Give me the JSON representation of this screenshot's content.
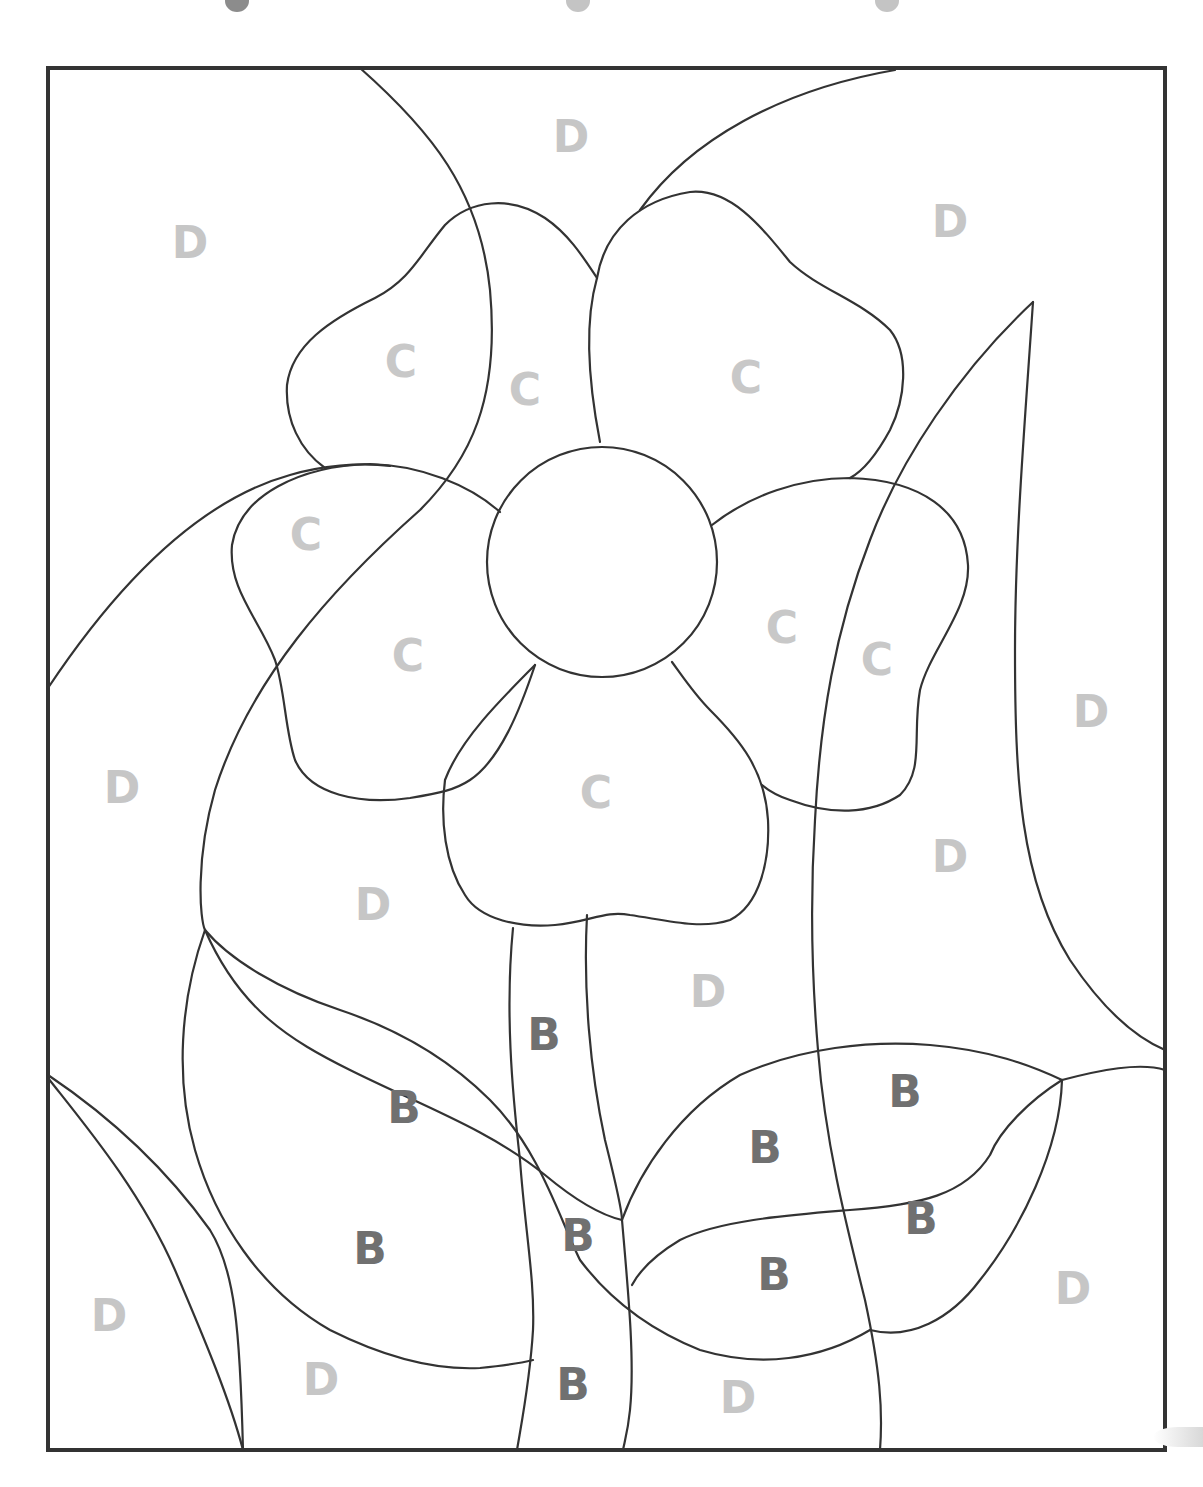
{
  "page": {
    "top_key_partial": {
      "swatches": [
        {
          "x": 225,
          "color": "#8c8c8c"
        },
        {
          "x": 566,
          "color": "#c4c4c4"
        },
        {
          "x": 875,
          "color": "#c4c4c4"
        }
      ]
    }
  },
  "legend_colors": {
    "B": "#707070",
    "C": "#c8c8c8",
    "D": "#c6c6c6"
  },
  "labels": [
    {
      "letter": "D",
      "x": 571,
      "y": 137
    },
    {
      "letter": "D",
      "x": 190,
      "y": 243
    },
    {
      "letter": "D",
      "x": 950,
      "y": 222
    },
    {
      "letter": "C",
      "x": 401,
      "y": 362
    },
    {
      "letter": "C",
      "x": 525,
      "y": 390
    },
    {
      "letter": "C",
      "x": 746,
      "y": 378
    },
    {
      "letter": "C",
      "x": 306,
      "y": 535
    },
    {
      "letter": "C",
      "x": 408,
      "y": 656
    },
    {
      "letter": "C",
      "x": 782,
      "y": 628
    },
    {
      "letter": "C",
      "x": 877,
      "y": 660
    },
    {
      "letter": "C",
      "x": 596,
      "y": 793
    },
    {
      "letter": "D",
      "x": 1091,
      "y": 712
    },
    {
      "letter": "D",
      "x": 122,
      "y": 788
    },
    {
      "letter": "D",
      "x": 950,
      "y": 857
    },
    {
      "letter": "D",
      "x": 373,
      "y": 905
    },
    {
      "letter": "D",
      "x": 708,
      "y": 992
    },
    {
      "letter": "B",
      "x": 544,
      "y": 1035
    },
    {
      "letter": "B",
      "x": 404,
      "y": 1108
    },
    {
      "letter": "B",
      "x": 905,
      "y": 1092
    },
    {
      "letter": "B",
      "x": 765,
      "y": 1148
    },
    {
      "letter": "B",
      "x": 921,
      "y": 1219
    },
    {
      "letter": "B",
      "x": 578,
      "y": 1236
    },
    {
      "letter": "B",
      "x": 370,
      "y": 1249
    },
    {
      "letter": "B",
      "x": 774,
      "y": 1275
    },
    {
      "letter": "D",
      "x": 1073,
      "y": 1289
    },
    {
      "letter": "D",
      "x": 109,
      "y": 1316
    },
    {
      "letter": "D",
      "x": 321,
      "y": 1380
    },
    {
      "letter": "B",
      "x": 573,
      "y": 1385
    },
    {
      "letter": "D",
      "x": 738,
      "y": 1398
    }
  ]
}
